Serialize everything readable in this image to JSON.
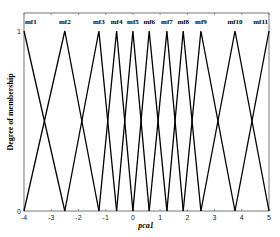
{
  "chart_data": {
    "type": "line",
    "title": "",
    "xlabel": "pca1",
    "ylabel": "Degree of membership",
    "xlim": [
      -4,
      5
    ],
    "ylim": [
      0,
      1
    ],
    "x_ticks": [
      -4,
      -3,
      -2,
      -1,
      0,
      1,
      2,
      3,
      4,
      5
    ],
    "y_ticks": [
      0,
      1
    ],
    "grid": false,
    "legend": "none",
    "series": [
      {
        "name": "mf1",
        "shape": "triangular",
        "points": [
          [
            -4,
            1
          ],
          [
            -2.5,
            0
          ]
        ]
      },
      {
        "name": "mf2",
        "shape": "triangular",
        "points": [
          [
            -4,
            0
          ],
          [
            -2.5,
            1
          ],
          [
            -1.25,
            0
          ]
        ]
      },
      {
        "name": "mf3",
        "shape": "triangular",
        "points": [
          [
            -2.5,
            0
          ],
          [
            -1.25,
            1
          ],
          [
            -0.6,
            0
          ]
        ]
      },
      {
        "name": "mf4",
        "shape": "triangular",
        "points": [
          [
            -1.25,
            0
          ],
          [
            -0.6,
            1
          ],
          [
            0,
            0
          ]
        ]
      },
      {
        "name": "mf5",
        "shape": "triangular",
        "points": [
          [
            -0.6,
            0
          ],
          [
            0,
            1
          ],
          [
            0.6,
            0
          ]
        ]
      },
      {
        "name": "mf6",
        "shape": "triangular",
        "points": [
          [
            0,
            0
          ],
          [
            0.6,
            1
          ],
          [
            1.25,
            0
          ]
        ]
      },
      {
        "name": "mf7",
        "shape": "triangular",
        "points": [
          [
            0.6,
            0
          ],
          [
            1.25,
            1
          ],
          [
            1.85,
            0
          ]
        ]
      },
      {
        "name": "mf8",
        "shape": "triangular",
        "points": [
          [
            1.25,
            0
          ],
          [
            1.85,
            1
          ],
          [
            2.5,
            0
          ]
        ]
      },
      {
        "name": "mf9",
        "shape": "triangular",
        "points": [
          [
            1.85,
            0
          ],
          [
            2.5,
            1
          ],
          [
            3.75,
            0
          ]
        ]
      },
      {
        "name": "mf10",
        "shape": "triangular",
        "points": [
          [
            2.5,
            0
          ],
          [
            3.75,
            1
          ],
          [
            5,
            0
          ]
        ]
      },
      {
        "name": "mf11",
        "shape": "triangular",
        "points": [
          [
            3.75,
            0
          ],
          [
            5,
            1
          ]
        ]
      }
    ],
    "line_color": "#000000"
  },
  "labels": {
    "xlabel": "pca1",
    "ylabel": "Degree of membership"
  }
}
